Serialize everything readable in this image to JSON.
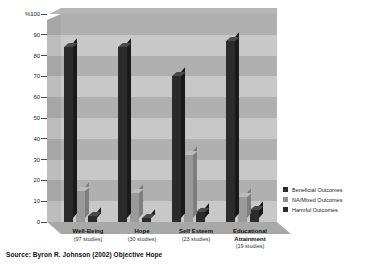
{
  "chart_data": {
    "type": "bar",
    "title": "",
    "subtitle": "",
    "xlabel": "",
    "ylabel": "%",
    "ylim": [
      0,
      100
    ],
    "grid": true,
    "legend_position": "right",
    "categories": [
      "Well-Being",
      "Hope",
      "Self Esteem",
      "Educational Attainment"
    ],
    "category_counts": [
      "(97 studies)",
      "(30 studies)",
      "(23 studies)",
      "(19 studies)"
    ],
    "series": [
      {
        "name": "Beneficial Outcomes",
        "color": "#2b2b2b",
        "values": [
          84,
          84,
          70,
          87
        ]
      },
      {
        "name": "NA/Mixed Outcomes",
        "color": "#8f8f8f",
        "values": [
          15,
          14,
          32,
          12
        ]
      },
      {
        "name": "Harmful Outcomes",
        "color": "#2b2b2b",
        "values": [
          3,
          2,
          5,
          6
        ]
      }
    ],
    "y_ticks": [
      "%100",
      "90",
      "80",
      "70",
      "60",
      "50",
      "40",
      "30",
      "20",
      "10",
      "0"
    ],
    "y_tick_values": [
      100,
      90,
      80,
      70,
      60,
      50,
      40,
      30,
      20,
      10,
      0
    ]
  },
  "legend": {
    "items": [
      {
        "label": "Beneficial Outcomes"
      },
      {
        "label": "NA/Mixed Outcomes"
      },
      {
        "label": "Harmful Outcomes"
      }
    ]
  },
  "footer": {
    "source": "Source: Byron R. Johnson (2002) Objective Hope"
  }
}
